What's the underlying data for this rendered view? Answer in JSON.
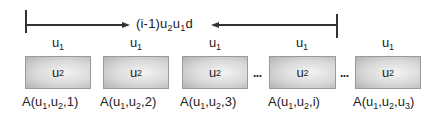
{
  "span": {
    "label_prefix": "(i-1)u",
    "label_sub1": "2",
    "label_mid": "u",
    "label_sub2": "1",
    "label_suffix": "d"
  },
  "slots": [
    {
      "top_var": "u",
      "top_sub": "1",
      "box_var": "u",
      "box_sub": "2",
      "label_pre": "A(u",
      "label_s1": "1",
      "label_mid": ",u",
      "label_s2": "2",
      "label_post": ",1)",
      "label_s3": "",
      "label_end": ""
    },
    {
      "top_var": "u",
      "top_sub": "1",
      "box_var": "u",
      "box_sub": "2",
      "label_pre": "A(u",
      "label_s1": "1",
      "label_mid": ",u",
      "label_s2": "2",
      "label_post": ",2)",
      "label_s3": "",
      "label_end": ""
    },
    {
      "top_var": "u",
      "top_sub": "1",
      "box_var": "u",
      "box_sub": "2",
      "label_pre": "A(u",
      "label_s1": "1",
      "label_mid": ",u",
      "label_s2": "2",
      "label_post": ",3)",
      "label_s3": "",
      "label_end": ""
    },
    {
      "top_var": "u",
      "top_sub": "1",
      "box_var": "u",
      "box_sub": "2",
      "label_pre": "A(u",
      "label_s1": "1",
      "label_mid": ",u",
      "label_s2": "2",
      "label_post": ",i)",
      "label_s3": "",
      "label_end": ""
    },
    {
      "top_var": "u",
      "top_sub": "1",
      "box_var": "u",
      "box_sub": "2",
      "label_pre": "A(u",
      "label_s1": "1",
      "label_mid": ",u",
      "label_s2": "2",
      "label_post": ",u",
      "label_s3": "3",
      "label_end": ")"
    }
  ],
  "ellipses": [
    "...",
    "..."
  ]
}
